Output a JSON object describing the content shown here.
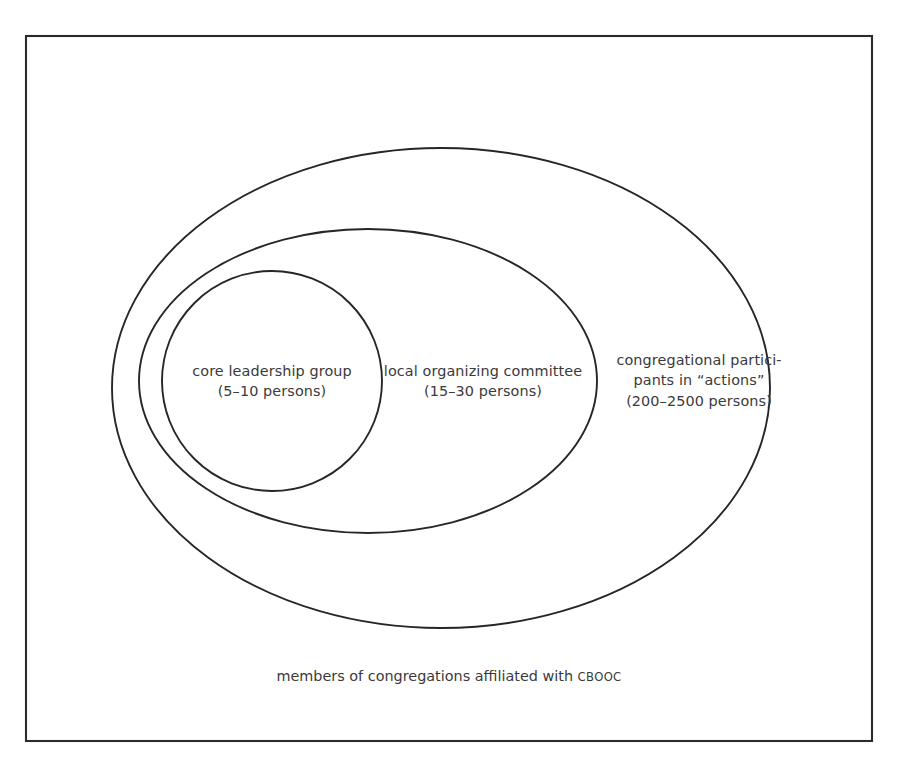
{
  "diagram": {
    "type": "nested-set-euler-diagram",
    "background_color": "#ffffff",
    "stroke_color": "#262626",
    "text_color": "#3a3a3a",
    "frame": {
      "name": "outer-border",
      "x": 26,
      "y": 36,
      "width": 846,
      "height": 705
    },
    "sets": [
      {
        "id": "participants",
        "shape": "ellipse",
        "cx": 441,
        "cy": 388,
        "rx": 329,
        "ry": 240,
        "label_lines": [
          "congregational partici-",
          "pants in “actions”",
          "(200–2500 persons)"
        ],
        "count_range": "200–2500 persons"
      },
      {
        "id": "committee",
        "shape": "ellipse",
        "cx": 368,
        "cy": 381,
        "rx": 229,
        "ry": 152,
        "label_lines": [
          "local organizing committee",
          "(15–30 persons)"
        ],
        "count_range": "15–30 persons"
      },
      {
        "id": "core",
        "shape": "circle",
        "cx": 272,
        "cy": 381,
        "r": 110,
        "label_lines": [
          "core leadership group",
          "(5–10 persons)"
        ],
        "count_range": "5–10 persons"
      }
    ],
    "caption": {
      "text_before": "members of congregations affiliated with ",
      "acronym": "CBOOC",
      "full_text": "members of congregations affiliated with CBOOC"
    }
  }
}
